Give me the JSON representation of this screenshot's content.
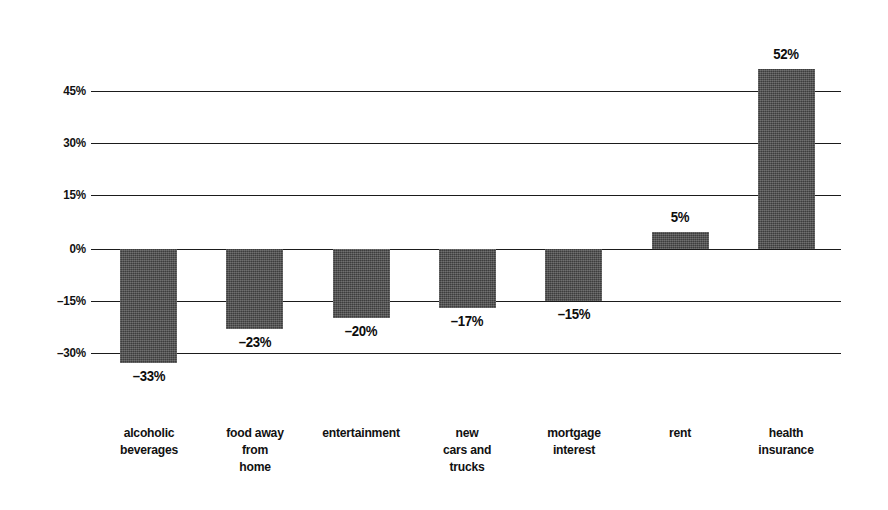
{
  "chart_data": {
    "type": "bar",
    "title": "",
    "subtitle": "",
    "xlabel": "",
    "ylabel": "",
    "categories": [
      "alcoholic beverages",
      "food away from home",
      "entertainment",
      "new cars and trucks",
      "mortgage interest",
      "rent",
      "health insurance"
    ],
    "category_lines": [
      [
        "alcoholic",
        "beverages"
      ],
      [
        "food away",
        "from",
        "home"
      ],
      [
        "entertainment"
      ],
      [
        "new",
        "cars and",
        "trucks"
      ],
      [
        "mortgage",
        "interest"
      ],
      [
        "rent"
      ],
      [
        "health",
        "insurance"
      ]
    ],
    "values": [
      -33,
      -23,
      -20,
      -17,
      -15,
      5,
      52
    ],
    "value_labels": [
      "–33%",
      "–23%",
      "–20%",
      "–17%",
      "–15%",
      "5%",
      "52%"
    ],
    "ylim": [
      -37,
      58
    ],
    "yticks": [
      45,
      30,
      15,
      0,
      -15,
      -30
    ],
    "ytick_labels": [
      "45%",
      "30%",
      "15%",
      "0%",
      "–15%",
      "–30%"
    ],
    "grid": true,
    "legend": "none",
    "bar_color": "#4a4a4a",
    "gridline_color": "#1b1b1b",
    "text_color": "#111111",
    "background_color": "#ffffff"
  }
}
